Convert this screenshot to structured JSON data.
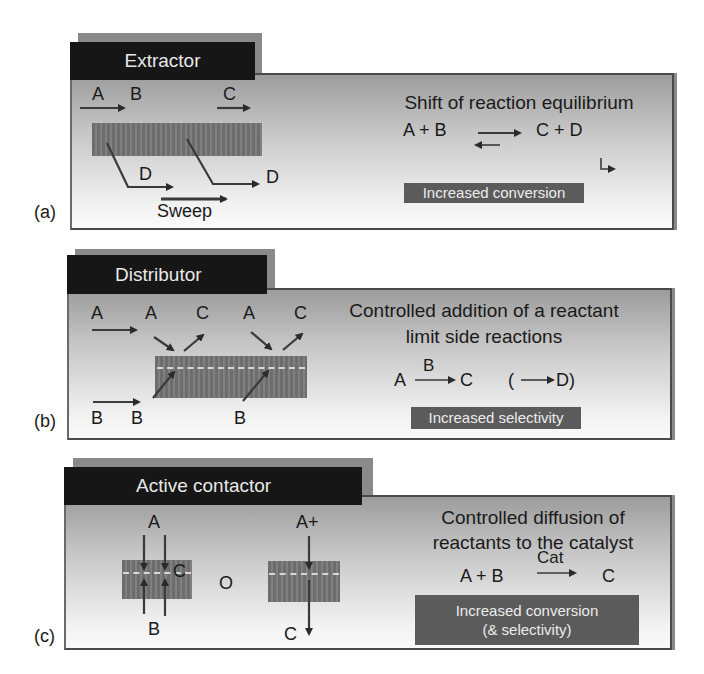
{
  "figure": {
    "panels": [
      {
        "id": "a",
        "panel_label": "(a)",
        "tab_title": "Extractor",
        "species_labels": {
          "a_in": "A",
          "b_in": "B",
          "c_out": "C",
          "d1": "D",
          "d2": "D",
          "sweep": "Sweep"
        },
        "description_lines": [
          "Shift of reaction equilibrium"
        ],
        "equation": {
          "left": "A + B",
          "arrow": "equilibrium",
          "right": "C + D"
        },
        "result_badge": [
          "Increased conversion"
        ]
      },
      {
        "id": "b",
        "panel_label": "(b)",
        "tab_title": "Distributor",
        "species_labels": {
          "a_feed": "A",
          "a1": "A",
          "c1": "C",
          "a2": "A",
          "c2": "C",
          "b_feed": "B",
          "b1": "B",
          "b2": "B"
        },
        "description_lines": [
          "Controlled addition of a reactant",
          "limit side reactions"
        ],
        "equation": {
          "left": "A",
          "over_arrow": "B",
          "right": "C",
          "side": "(",
          "side_product": "D)"
        },
        "result_badge": [
          "Increased selectivity"
        ]
      },
      {
        "id": "c",
        "panel_label": "(c)",
        "tab_title": "Active contactor",
        "species_labels": {
          "left_a": "A",
          "left_c": "C",
          "left_b": "B",
          "or": "O",
          "right_a": "A+",
          "right_c": "C"
        },
        "description_lines": [
          "Controlled diffusion of",
          "reactants to the catalyst"
        ],
        "equation": {
          "left": "A + B",
          "over_arrow": "Cat",
          "right": "C"
        },
        "result_badge": [
          "Increased conversion",
          "(& selectivity)"
        ]
      }
    ],
    "colors": {
      "tab_bg": "#161616",
      "tab_text": "#e8e8e8",
      "badge_bg": "#5b5b5b",
      "badge_text": "#ececec",
      "membrane": "#767676",
      "border": "#4a4a4a"
    }
  }
}
